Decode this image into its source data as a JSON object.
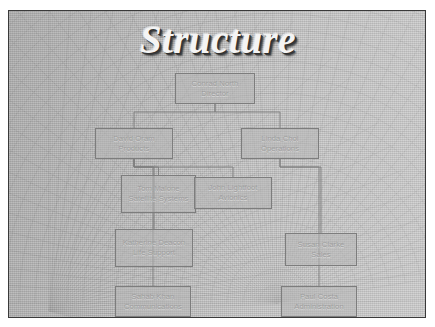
{
  "slide": {
    "title": "Structure",
    "background_color": "#b9b9b9",
    "frame_border_color": "#3a3a3a",
    "title_color": "#f4f4f4",
    "node_border_color": "#7d7d7d",
    "node_fill_color": "#b7b7b7",
    "node_text_color": "#9d9d9d",
    "connector_color": "#7e7e7e",
    "decoration": "radial-fan-wire-mesh"
  },
  "org_chart": {
    "nodes": [
      {
        "id": "director",
        "name": "Conrad North",
        "role": "Director",
        "x": 166,
        "y": 62,
        "w": 80,
        "h": 31
      },
      {
        "id": "products",
        "name": "David Oram",
        "role": "Products",
        "x": 86,
        "y": 117,
        "w": 78,
        "h": 31
      },
      {
        "id": "operations",
        "name": "Linda Choi",
        "role": "Operations",
        "x": 232,
        "y": 117,
        "w": 78,
        "h": 31
      },
      {
        "id": "satellite",
        "name": "Tom Malone",
        "role": "Satellite Systems",
        "x": 112,
        "y": 164,
        "w": 75,
        "h": 38
      },
      {
        "id": "avionics",
        "name": "John Lightfoot",
        "role": "Avionics",
        "x": 185,
        "y": 166,
        "w": 78,
        "h": 32
      },
      {
        "id": "life-support",
        "name": "Katherine Deacon",
        "role": "Life Support",
        "x": 106,
        "y": 218,
        "w": 78,
        "h": 38
      },
      {
        "id": "sales",
        "name": "Susan Clarke",
        "role": "Sales",
        "x": 276,
        "y": 222,
        "w": 72,
        "h": 33
      },
      {
        "id": "communications",
        "name": "Sahab Khan",
        "role": "Communications",
        "x": 106,
        "y": 275,
        "w": 76,
        "h": 31
      },
      {
        "id": "administration",
        "name": "Paul Costa",
        "role": "Administration",
        "x": 272,
        "y": 275,
        "w": 76,
        "h": 31
      }
    ],
    "connections": [
      {
        "from": "director",
        "to": "products"
      },
      {
        "from": "director",
        "to": "operations"
      },
      {
        "from": "products",
        "to": "satellite"
      },
      {
        "from": "products",
        "to": "avionics"
      },
      {
        "from": "products",
        "to": "life-support"
      },
      {
        "from": "products",
        "to": "communications"
      },
      {
        "from": "operations",
        "to": "sales"
      },
      {
        "from": "operations",
        "to": "administration"
      }
    ]
  }
}
